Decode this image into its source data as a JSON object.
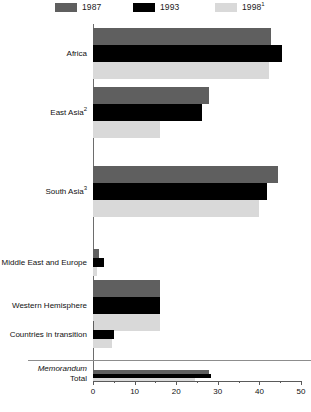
{
  "legend": {
    "items": [
      {
        "label": "1987",
        "sup": "",
        "color": "#5f5f5f"
      },
      {
        "label": "1993",
        "sup": "",
        "color": "#000000"
      },
      {
        "label": "1998",
        "sup": "1",
        "color": "#d9d9d9"
      }
    ]
  },
  "memorandum": {
    "word": "Memorandum",
    "total": "Total"
  },
  "chart_data": {
    "type": "bar",
    "orientation": "horizontal",
    "title": "",
    "xlabel": "",
    "ylabel": "",
    "xlim": [
      0,
      50
    ],
    "xticks": [
      0,
      10,
      20,
      30,
      40,
      50
    ],
    "xtick_labels": [
      "0",
      "10",
      "20",
      "30",
      "40",
      "50"
    ],
    "minor_tick_step": 5,
    "grid": false,
    "legend_position": "top",
    "categories": [
      "Africa",
      "East Asia",
      "South Asia",
      "Middle East and Europe",
      "Western Hemisphere",
      "Countries in transition"
    ],
    "category_footnotes": [
      "",
      "2",
      "3",
      "",
      "",
      ""
    ],
    "series": [
      {
        "name": "1987",
        "color": "#5f5f5f",
        "values": [
          42.7,
          28.0,
          44.5,
          1.5,
          16.2,
          0.3
        ]
      },
      {
        "name": "1993",
        "color": "#000000",
        "values": [
          45.4,
          26.3,
          41.8,
          2.6,
          16.2,
          5.0
        ]
      },
      {
        "name": "1998",
        "color": "#d9d9d9",
        "values": [
          42.2,
          16.2,
          39.8,
          1.0,
          16.2,
          4.6
        ]
      }
    ],
    "memorandum_rows": [
      {
        "label": "Total",
        "values": [
          {
            "name": "1987",
            "color": "#5f5f5f",
            "value": 27.8
          },
          {
            "name": "1993",
            "color": "#000000",
            "value": 28.3
          },
          {
            "name": "1998",
            "color": "#d9d9d9",
            "value": 24.6
          }
        ]
      }
    ]
  }
}
